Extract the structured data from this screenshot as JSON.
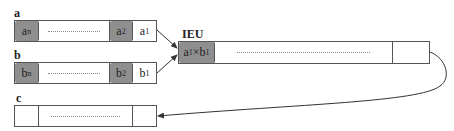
{
  "registers": {
    "a": {
      "label": "a",
      "cells": [
        {
          "base": "a",
          "sub": "n",
          "shaded": true
        },
        {
          "dots": true
        },
        {
          "base": "a",
          "sub": "2",
          "shaded": true
        },
        {
          "base": "a",
          "sub": "1",
          "shaded": false
        }
      ]
    },
    "b": {
      "label": "b",
      "cells": [
        {
          "base": "b",
          "sub": "n",
          "shaded": true
        },
        {
          "dots": true
        },
        {
          "base": "b",
          "sub": "2",
          "shaded": true
        },
        {
          "base": "b",
          "sub": "1",
          "shaded": false
        }
      ]
    },
    "ieu": {
      "label": "IEU",
      "first_cell": {
        "a": "a",
        "a_sub": "1",
        "op": "×",
        "b": "b",
        "b_sub": "1",
        "shaded": true
      }
    },
    "c": {
      "label": "c"
    }
  },
  "colors": {
    "shaded": "#8f8f8f",
    "border": "#555555",
    "arrow": "#333333"
  }
}
